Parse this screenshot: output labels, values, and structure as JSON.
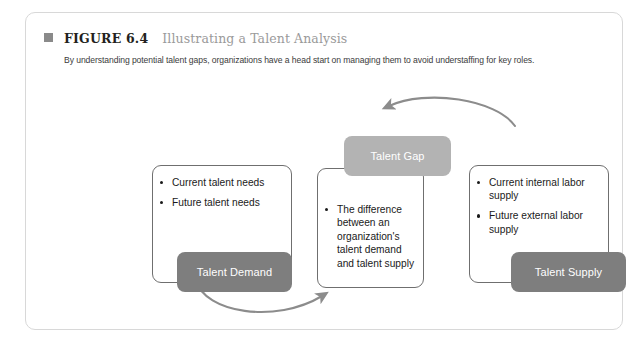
{
  "figure": {
    "marker_icon": "square-bullet-icon",
    "label": "FIGURE 6.4",
    "title": "Illustrating a Talent Analysis",
    "subtitle": "By understanding potential talent gaps, organizations have a head start on managing them to avoid understaffing for key roles."
  },
  "diagram": {
    "demand": {
      "tab_label": "Talent Demand",
      "bullets": [
        "Current talent needs",
        "Future talent needs"
      ]
    },
    "gap": {
      "tab_label": "Talent Gap",
      "bullets": [
        "The difference between an organization's talent demand and talent supply"
      ]
    },
    "supply": {
      "tab_label": "Talent Supply",
      "bullets": [
        "Current internal labor supply",
        "Future external labor supply"
      ]
    },
    "arrows": [
      {
        "name": "supply-to-gap-arrow",
        "from": "Talent Supply",
        "to": "Talent Gap",
        "direction": "right-to-left-over-top"
      },
      {
        "name": "demand-to-gap-arrow",
        "from": "Talent Demand",
        "to": "Talent Gap",
        "direction": "left-to-right-under-bottom"
      }
    ]
  },
  "colors": {
    "tab_dark_gray": "#7e7e7e",
    "tab_light_gray": "#b3b3b3",
    "box_outline": "#6f6f6f",
    "frame_border": "#d8d8d8",
    "arrow": "#8c8c8c",
    "title_gray": "#9a9a9a"
  }
}
